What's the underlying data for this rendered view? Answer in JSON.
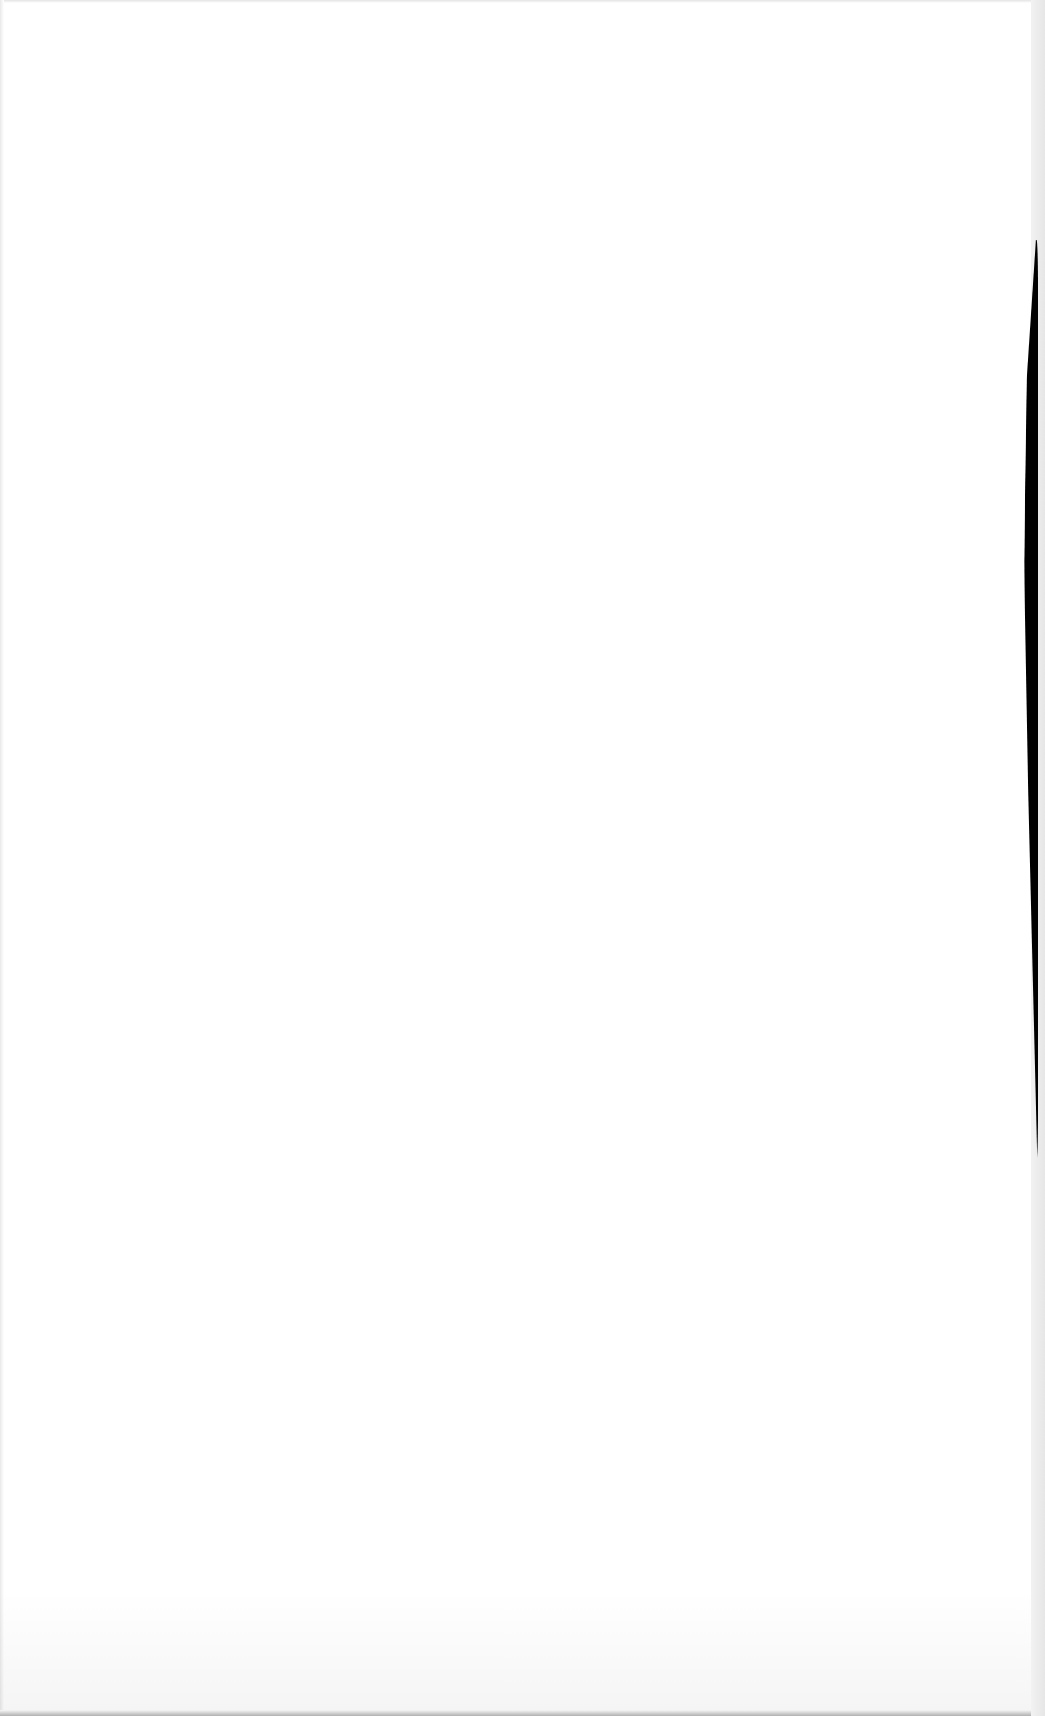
{
  "document": {
    "page_type": "blank scanned page",
    "text_content": "",
    "colors": {
      "paper": "#ffffff",
      "binding_shadow": "#000000",
      "edge": "#e6e6e6"
    }
  }
}
